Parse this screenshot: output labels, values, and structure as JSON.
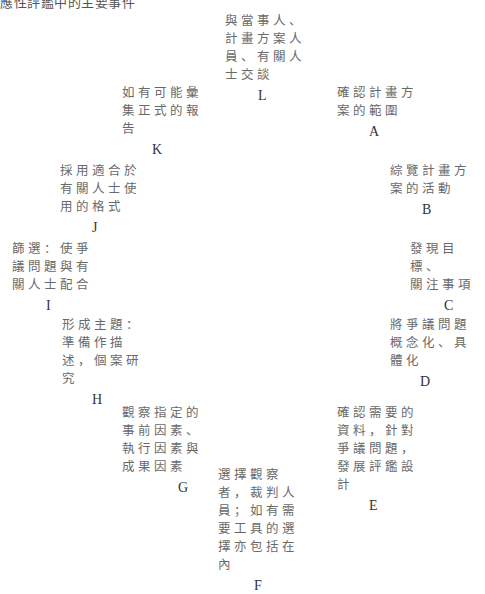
{
  "title": "應性評鑑中的主要事件",
  "nodes": {
    "L": {
      "text": "與當事人、\n計畫方案人\n員、有關人\n士交談",
      "letter": "L"
    },
    "A": {
      "text": "確認計畫方\n案的範圍",
      "letter": "A"
    },
    "B": {
      "text": "綜覽計畫方\n案的活動",
      "letter": "B"
    },
    "C": {
      "text": "發現目標、\n關注事項",
      "letter": "C"
    },
    "D": {
      "text": "將爭議問題\n概念化、具\n體化",
      "letter": "D"
    },
    "E": {
      "text": "確認需要的\n資料，針對\n爭議問題，\n發展評鑑設\n計",
      "letter": "E"
    },
    "F": {
      "text": "選擇觀察\n者，裁判人\n員；如有需\n要工具的選\n擇亦包括在\n內",
      "letter": "F"
    },
    "G": {
      "text": "觀察指定的\n事前因素、\n執行因素與\n成果因素",
      "letter": "G"
    },
    "H": {
      "text": "形成主題：\n準備作描\n述，個案研\n究",
      "letter": "H"
    },
    "I": {
      "text": "篩選：使爭\n議問題與有\n關人士配合",
      "letter": "I"
    },
    "J": {
      "text": "採用適合於\n有關人士使\n用的格式",
      "letter": "J"
    },
    "K": {
      "text": "如有可能彙\n集正式的報\n告",
      "letter": "K"
    }
  }
}
